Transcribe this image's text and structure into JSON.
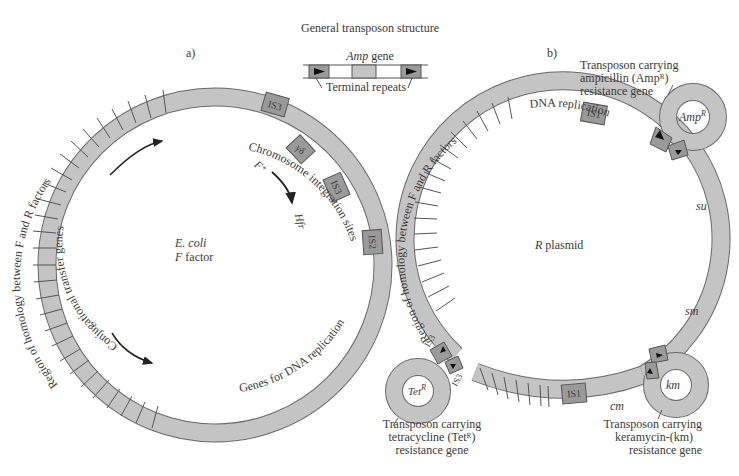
{
  "title": "General transposon structure",
  "general_structure": {
    "gene_label": "Amp",
    "gene_suffix": " gene",
    "repeats_label": "Terminal repeats"
  },
  "panel_a": {
    "panel_label": "a)",
    "center_line1": "E. coli",
    "center_line2_italic": "F",
    "center_line2_rest": " factor",
    "homology_label": "Region of homology between F and R factors",
    "conjugational_label": "Conjugational  transfer  genes",
    "chromosome_label": "Chromosome integration sites",
    "dna_replication_label": "Genes for DNA replication",
    "f_plus": "F⁺",
    "hfr": "Hfr",
    "is_elements": [
      "IS3",
      "γδ",
      "IS3",
      "IS2"
    ]
  },
  "panel_b": {
    "panel_label": "b)",
    "center_italic": "R",
    "center_rest": " plasmid",
    "homology_label": "Region of homology between F and R factors",
    "dna_replication_label": "DNA replication",
    "genes": [
      "su",
      "sm",
      "cm"
    ],
    "is_elements": [
      "IS1",
      "IS1",
      "IS3",
      "IS3"
    ],
    "transposons": {
      "amp": {
        "loop_label": "Amp",
        "loop_sup": "R",
        "caption": [
          "Transposon carrying",
          "ampicillin (Ampᴿ)",
          "resistance gene"
        ]
      },
      "tet": {
        "loop_label": "Tet",
        "loop_sup": "R",
        "caption": [
          "Transposon carrying",
          "tetracycline (Tetᴿ)",
          "resistance gene"
        ]
      },
      "km": {
        "loop_label": "km",
        "caption": [
          "Transposon carrying",
          "keramycin-(km)",
          "resistance gene"
        ]
      }
    }
  },
  "colors": {
    "ring_fill": "#c4c4c4",
    "ring_stroke": "#6a6a6a",
    "is_fill": "#9a9a9a",
    "text": "#3a3a3a"
  }
}
